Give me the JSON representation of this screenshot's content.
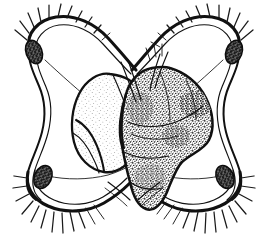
{
  "figure": {
    "technique": "ink line drawing with stipple shading",
    "background_color": "#ffffff",
    "ink_color": "#111111",
    "caption": "",
    "canvas": {
      "width": 268,
      "height": 245
    }
  },
  "parts": {
    "lobe_upper_left": {
      "name": "upper-left ciliated lobe",
      "organ_label": "pigmented ocellus",
      "organ_color": "#2b2b2b",
      "cilia_count": 11
    },
    "lobe_upper_right": {
      "name": "upper-right ciliated lobe",
      "organ_label": "pigmented ocellus",
      "organ_color": "#2b2b2b",
      "cilia_count": 12
    },
    "lobe_lower_left": {
      "name": "lower-left ciliated lobe",
      "organ_label": "pigmented ocellus",
      "organ_color": "#2b2b2b",
      "setae_count": 12
    },
    "lobe_lower_right": {
      "name": "lower-right ciliated lobe",
      "organ_label": "pigmented ocellus",
      "organ_color": "#2b2b2b",
      "setae_count": 13
    },
    "body_light": {
      "name": "anterior pale body lobe",
      "shading": "fine stipple",
      "fill": "#ffffff"
    },
    "body_dark": {
      "name": "posterior dark visceral mass",
      "shading": "dense stipple",
      "fill": "#ffffff"
    },
    "stalks": {
      "name": "lobe connecting stalks",
      "count": 4
    }
  }
}
